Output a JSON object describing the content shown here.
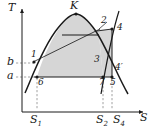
{
  "figure": {
    "kind": "thermodynamic-temperature-entropy-diagram",
    "background": "#ffffff",
    "ink": "#1a1a1a",
    "dome_fill": "#d6d6d6",
    "dashed_color": "#7a7a7a",
    "axes": {
      "y_label": "T",
      "x_label": "S",
      "origin": {
        "x": 22,
        "y": 112
      },
      "x_end": 146,
      "y_top": 6
    },
    "axis_value_labels": [
      {
        "name": "b",
        "text": "b",
        "x": 6,
        "y": 57,
        "axis": "y"
      },
      {
        "name": "a",
        "text": "a",
        "x": 6,
        "y": 72,
        "axis": "y"
      }
    ],
    "entropy_tick_labels": [
      {
        "name": "S1",
        "text": "S",
        "sub": "1",
        "x": 29,
        "y": 116
      },
      {
        "name": "S2",
        "text": "S",
        "sub": "2",
        "x": 98,
        "y": 116
      },
      {
        "name": "S4",
        "text": "S",
        "sub": "4",
        "x": 115,
        "y": 116
      }
    ],
    "point_labels": [
      {
        "name": "critical-point-K",
        "text": "K",
        "x": 68,
        "y": 3
      },
      {
        "name": "state-1",
        "text": "1",
        "x": 30,
        "y": 53
      },
      {
        "name": "state-2",
        "text": "2",
        "x": 100,
        "y": 19
      },
      {
        "name": "state-3",
        "text": "3",
        "x": 95,
        "y": 58
      },
      {
        "name": "state-4",
        "text": "4",
        "x": 117,
        "y": 24
      },
      {
        "name": "state-4-prime",
        "text": "4′",
        "x": 116,
        "y": 67
      },
      {
        "name": "state-5",
        "text": "5",
        "x": 109,
        "y": 80
      },
      {
        "name": "state-6",
        "text": "6",
        "x": 36,
        "y": 80
      },
      {
        "name": "state-7",
        "text": "7",
        "x": 98,
        "y": 80
      }
    ],
    "markers": [
      {
        "name": "marker-K",
        "x": 76,
        "y": 15
      },
      {
        "name": "marker-1",
        "x": 34,
        "y": 63
      },
      {
        "name": "marker-4",
        "x": 113,
        "y": 29
      },
      {
        "name": "marker-6",
        "x": 37,
        "y": 77
      },
      {
        "name": "marker-7",
        "x": 103,
        "y": 77
      },
      {
        "name": "marker-5",
        "x": 112,
        "y": 77
      },
      {
        "name": "marker-4p",
        "x": 112,
        "y": 70
      }
    ],
    "geometry": {
      "saturation_dome": "M 25,92 C 32,78 42,44 58,26 C 66,17 72,14 76,14 C 81,14 87,18 95,29 C 106,45 117,75 127,93",
      "isotherm_top": "M 62,35 L 99,35",
      "isotherm_bottom": "M 37,77 L 112,77",
      "right_boundary": "M 99,35 L 103,77",
      "isentrope_2_to_4": "M 96,30 L 113,29",
      "steep_line": "M 102,92 C 108,60 112,32 120,12",
      "vertical_5_4": "M 112,29 L 112,77",
      "lower_tail": "M 112,77 C 118,82 124,88 131,95"
    },
    "dashed_guides": [
      {
        "name": "guide-b-horizontal",
        "x1": 16,
        "y1": 63,
        "x2": 34,
        "y2": 63
      },
      {
        "name": "guide-a-horizontal",
        "x1": 16,
        "y1": 77,
        "x2": 37,
        "y2": 77
      },
      {
        "name": "guide-S1-vertical",
        "x1": 37,
        "y1": 77,
        "x2": 37,
        "y2": 111
      },
      {
        "name": "guide-S2-vertical",
        "x1": 103,
        "y1": 77,
        "x2": 103,
        "y2": 111
      },
      {
        "name": "guide-S4-vertical",
        "x1": 112,
        "y1": 77,
        "x2": 112,
        "y2": 111
      }
    ],
    "pointer_leader": {
      "name": "leader-2",
      "x1": 99,
      "y1": 28,
      "x2": 107,
      "y2": 22
    }
  }
}
